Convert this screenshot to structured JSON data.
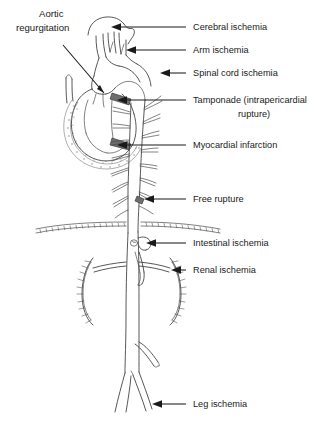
{
  "figure": {
    "background_color": "#ffffff",
    "line_color": "#3a3a3a",
    "text_color": "#1a1a1a",
    "shade_color": "#6e6e6e"
  },
  "labels": {
    "aortic_regurgitation_line1": "Aortic",
    "aortic_regurgitation_line2": "regurgitation",
    "cerebral_ischemia": "Cerebral ischemia",
    "arm_ischemia": "Arm ischemia",
    "spinal_cord_ischemia": "Spinal cord ischemia",
    "tamponade_line1": "Tamponade (intrapericardial",
    "tamponade_line2": "rupture)",
    "myocardial_infarction": "Myocardial infarction",
    "free_rupture": "Free rupture",
    "intestinal_ischemia": "Intestinal ischemia",
    "renal_ischemia": "Renal ischemia",
    "leg_ischemia": "Leg ischemia"
  },
  "callouts": [
    {
      "id": "aortic-regurgitation",
      "label": "Aortic regurgitation",
      "side": "left",
      "target": "aortic valve / root"
    },
    {
      "id": "cerebral-ischemia",
      "label": "Cerebral ischemia",
      "side": "right",
      "target": "carotid arteries"
    },
    {
      "id": "arm-ischemia",
      "label": "Arm ischemia",
      "side": "right",
      "target": "subclavian artery"
    },
    {
      "id": "spinal-cord-ischemia",
      "label": "Spinal cord ischemia",
      "side": "right",
      "target": "intercostal arteries"
    },
    {
      "id": "tamponade",
      "label": "Tamponade (intrapericardial rupture)",
      "side": "right",
      "target": "pericardial space"
    },
    {
      "id": "myocardial-infarction",
      "label": "Myocardial infarction",
      "side": "right",
      "target": "coronary artery"
    },
    {
      "id": "free-rupture",
      "label": "Free rupture",
      "side": "right",
      "target": "descending thoracic aorta"
    },
    {
      "id": "intestinal-ischemia",
      "label": "Intestinal ischemia",
      "side": "right",
      "target": "celiac / superior mesenteric artery"
    },
    {
      "id": "renal-ischemia",
      "label": "Renal ischemia",
      "side": "right",
      "target": "renal artery"
    },
    {
      "id": "leg-ischemia",
      "label": "Leg ischemia",
      "side": "right",
      "target": "iliac artery"
    }
  ]
}
